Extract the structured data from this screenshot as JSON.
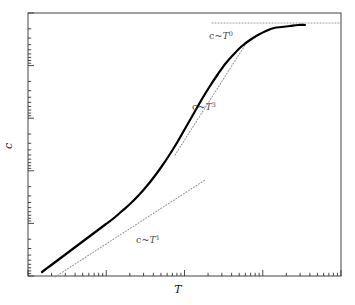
{
  "figure": {
    "background_color": "#ffffff",
    "frame_color": "#555555",
    "curve_color": "#000000",
    "guide_color": "#9a9a9a",
    "tick_color": "#333333",
    "label_color": "#4a4a4a",
    "axis_title_color": "#1a1a1a"
  },
  "axes": {
    "x_title": "T",
    "y_title": "c",
    "x_scale": "log",
    "y_scale": "log",
    "grid": false,
    "frame": {
      "left": 28,
      "right": 341,
      "top": 13,
      "bottom": 276
    }
  },
  "labels": {
    "linear": {
      "prefix": "c~",
      "var": "T",
      "exponent": "1"
    },
    "cubic": {
      "prefix": "c~",
      "var": "T",
      "exponent": "3"
    },
    "saturation": {
      "prefix": "c~",
      "var": "T",
      "exponent": "0"
    }
  },
  "chart_data": {
    "type": "line",
    "title": "",
    "subtitle": "",
    "xlabel": "T",
    "ylabel": "c",
    "xscale": "log",
    "yscale": "log",
    "grid": false,
    "legend": "none",
    "xlim": [
      1,
      10000
    ],
    "ylim": [
      1,
      10000
    ],
    "annotations": [
      {
        "text": "c~T^1",
        "x_px": 148,
        "y_px": 243,
        "role": "low-temperature linear asymptote label"
      },
      {
        "text": "c~T^3",
        "x_px": 204,
        "y_px": 110,
        "role": "Debye T-cubed regime label"
      },
      {
        "text": "c~T^0",
        "x_px": 221,
        "y_px": 39,
        "role": "high-temperature Dulong-Petit saturation label"
      }
    ],
    "series": [
      {
        "name": "specific heat c(T)",
        "style": "solid",
        "color": "#000000",
        "width": 2.2,
        "points_px": [
          [
            42,
            272
          ],
          [
            50,
            266
          ],
          [
            58,
            260
          ],
          [
            66,
            254
          ],
          [
            74,
            248
          ],
          [
            82,
            242
          ],
          [
            90,
            236
          ],
          [
            98,
            230
          ],
          [
            106,
            224
          ],
          [
            114,
            218
          ],
          [
            122,
            211
          ],
          [
            130,
            204
          ],
          [
            138,
            196
          ],
          [
            146,
            187
          ],
          [
            154,
            177
          ],
          [
            162,
            166
          ],
          [
            170,
            154
          ],
          [
            178,
            141
          ],
          [
            186,
            127
          ],
          [
            194,
            113
          ],
          [
            202,
            99
          ],
          [
            210,
            86
          ],
          [
            218,
            74
          ],
          [
            226,
            63
          ],
          [
            234,
            54
          ],
          [
            242,
            46
          ],
          [
            250,
            40
          ],
          [
            258,
            35
          ],
          [
            266,
            31
          ],
          [
            274,
            28
          ],
          [
            282,
            27
          ],
          [
            290,
            26
          ],
          [
            298,
            25
          ],
          [
            305,
            25
          ]
        ]
      }
    ],
    "guide_lines": [
      {
        "name": "T^1 asymptote",
        "style": "dotted",
        "color": "#9a9a9a",
        "slope_exponent": 1,
        "points_px": [
          [
            55,
            277
          ],
          [
            205,
            180
          ]
        ]
      },
      {
        "name": "T^3 asymptote",
        "style": "dotted",
        "color": "#9a9a9a",
        "slope_exponent": 3,
        "points_px": [
          [
            175,
            155
          ],
          [
            247,
            42
          ]
        ]
      },
      {
        "name": "T^0 saturation asymptote",
        "style": "dotted",
        "color": "#9a9a9a",
        "slope_exponent": 0,
        "points_px": [
          [
            212,
            23
          ],
          [
            341,
            23
          ]
        ]
      }
    ]
  }
}
